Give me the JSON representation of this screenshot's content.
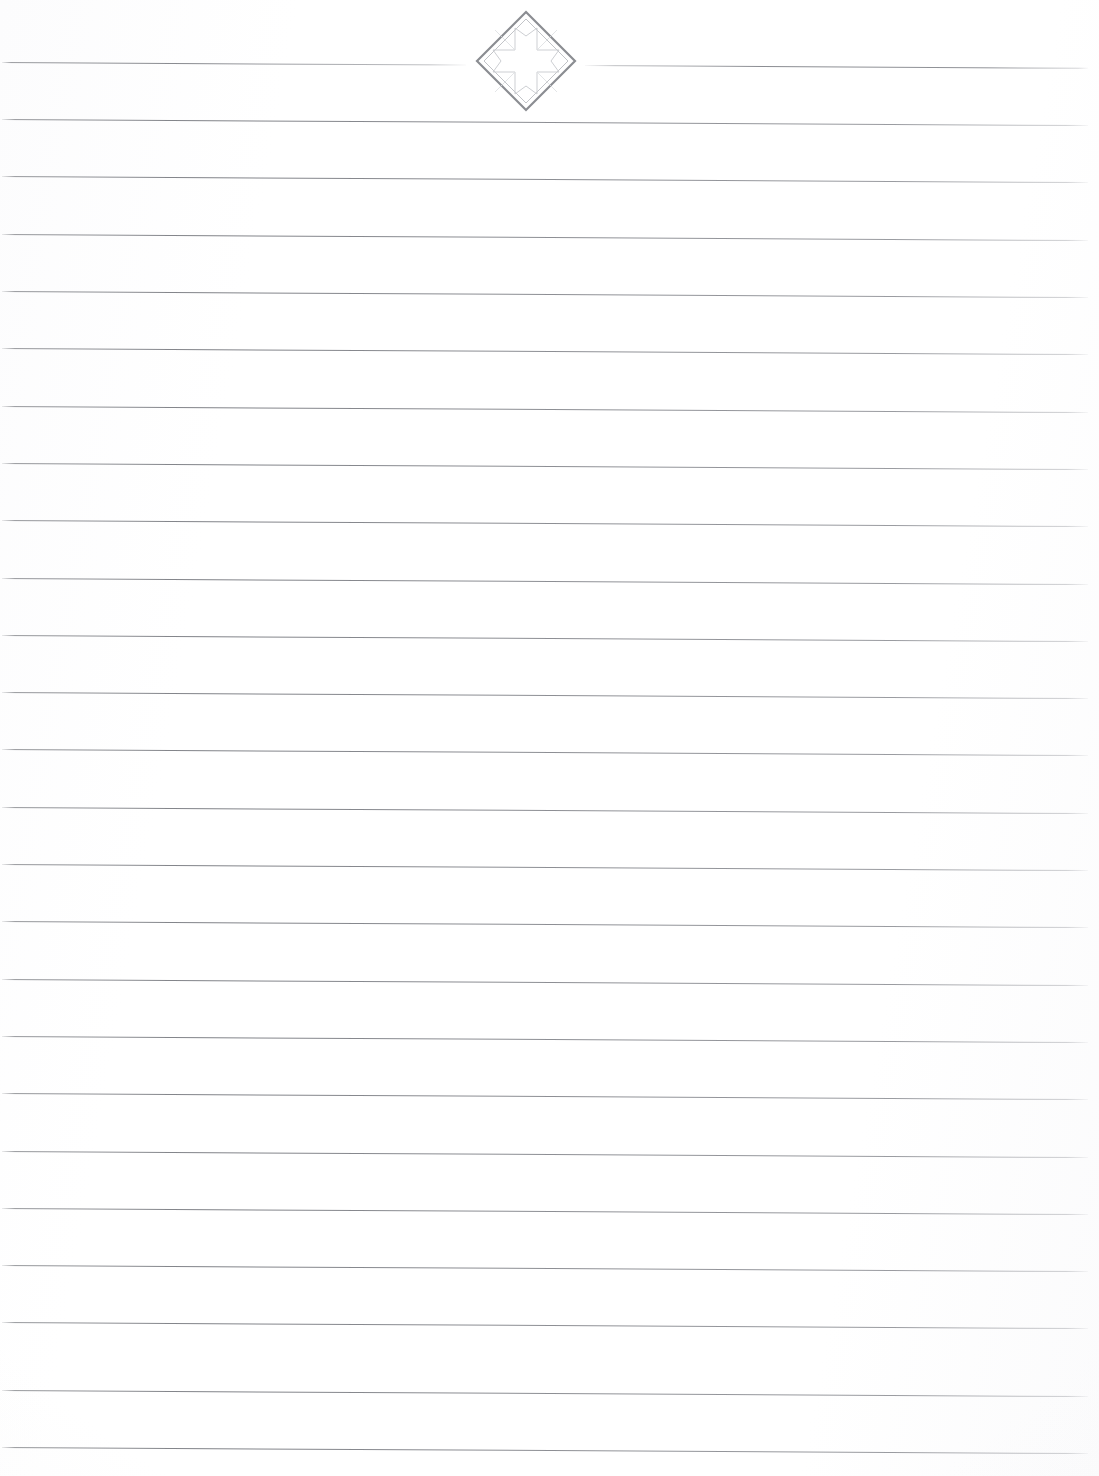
{
  "page": {
    "kind": "lined-stationery-page",
    "width": 1099,
    "height": 1476,
    "background_color": "#fefefe",
    "paper_tint": "#fbfbfc",
    "content_text": "",
    "is_blank": true
  },
  "ornament": {
    "name": "diamond-compass-rose-ornament",
    "description": "Rotated square with a nested inner diamond and an eight-point compass-star with notched arrow tips",
    "center_x": 526,
    "center_y": 61,
    "outer_stroke_color": "#8b8d92",
    "inner_stroke_color": "#c2c4c8",
    "star_stroke_color": "#cdcfd3",
    "outer_stroke_width": 2.2,
    "inner_stroke_width": 1.0,
    "star_stroke_width": 1.0,
    "fill": "none"
  },
  "rules": {
    "name": "ruled-writing-lines",
    "color": "#7e8085",
    "thickness_px": 1,
    "spacing_px": 57.3,
    "first_line_y": 62,
    "left_x": 2,
    "right_x": 1088,
    "slope_deg": 0.32,
    "count": 25,
    "split_line_index": 0,
    "split_gap_left_x": 466,
    "split_gap_right_x": 585,
    "y_positions": [
      62,
      119,
      176,
      234,
      291,
      348,
      406,
      463,
      520,
      578,
      635,
      692,
      749,
      807,
      864,
      921,
      979,
      1036,
      1093,
      1151,
      1208,
      1265,
      1322,
      1390,
      1447
    ]
  }
}
